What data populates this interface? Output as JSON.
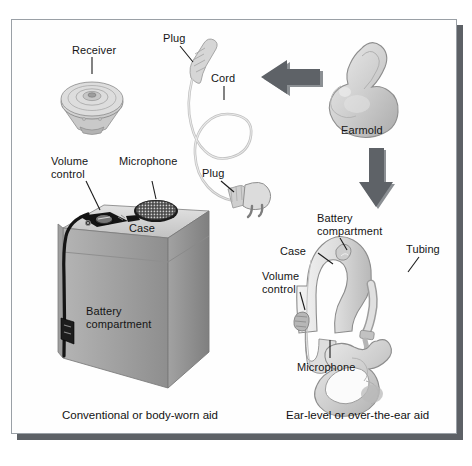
{
  "figure": {
    "title_absent": true,
    "type": "labeled anatomical/product diagram of hearing aids",
    "background_color": "#ffffff",
    "panel_color": "#fefefe",
    "panel_border_color": "#9aa0a6",
    "shadow_color": "#5d6166",
    "ink_color": "#151515",
    "arrow_color": "#5e6267",
    "device_body_color": "#9d9d9d",
    "device_light_color": "#e6e6e6",
    "device_dark_color": "#1a1a1a"
  },
  "left_panel": {
    "caption": "Conventional or body-worn aid",
    "labels": {
      "receiver": "Receiver",
      "volume_control": "Volume\ncontrol",
      "microphone": "Microphone",
      "case": "Case",
      "battery_compartment": "Battery\ncompartment",
      "plug_top": "Plug",
      "cord": "Cord",
      "plug_bottom": "Plug"
    }
  },
  "right_panel": {
    "caption": "Ear-level or over-the-ear aid",
    "labels": {
      "earmold": "Earmold",
      "battery_compartment": "Battery\ncompartment",
      "case": "Case",
      "volume_control": "Volume\ncontrol",
      "tubing": "Tubing",
      "microphone": "Microphone"
    }
  },
  "arrows": [
    {
      "name": "arrow-left",
      "direction": "left",
      "color": "#5e6267"
    },
    {
      "name": "arrow-down",
      "direction": "down",
      "color": "#5e6267"
    }
  ]
}
